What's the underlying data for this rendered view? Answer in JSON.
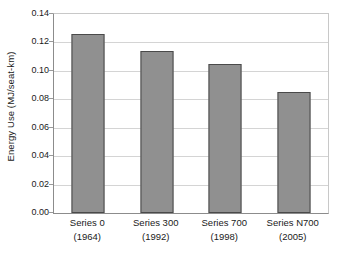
{
  "chart_data": {
    "type": "bar",
    "title": "",
    "xlabel": "",
    "ylabel": "Energy Use (MJ/seat-km)",
    "categories": [
      "Series 0",
      "Series 300",
      "Series 700",
      "Series N700"
    ],
    "category_sublabels": [
      "(1964)",
      "(1992)",
      "(1998)",
      "(2005)"
    ],
    "values": [
      0.126,
      0.114,
      0.105,
      0.085
    ],
    "ylim": [
      0.0,
      0.14
    ],
    "ytick_values": [
      0.0,
      0.02,
      0.04,
      0.06,
      0.08,
      0.1,
      0.12,
      0.14
    ],
    "ytick_labels": [
      "0.00",
      "0.02",
      "0.04",
      "0.06",
      "0.08",
      "0.10",
      "0.12",
      "0.14"
    ],
    "grid": true,
    "grid_axis": "y",
    "legend": false,
    "legend_position": "none",
    "series": [
      {
        "name": "Energy Use",
        "values": [
          0.126,
          0.114,
          0.105,
          0.085
        ]
      }
    ],
    "colors": {
      "bar_fill": "#909090",
      "bar_border": "#4a4a4a",
      "gridline": "#d4d4d4",
      "axis": "#8c8c8c",
      "plot_background": "#ffffff",
      "text": "#1a1a1a"
    }
  }
}
